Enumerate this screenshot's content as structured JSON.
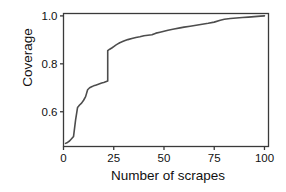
{
  "chart_data": {
    "type": "line",
    "title": "",
    "subtitle": "",
    "xlabel": "Number of scrapes",
    "ylabel": "Coverage",
    "xlim": [
      0,
      102
    ],
    "ylim": [
      0.455,
      1.01
    ],
    "xticks": [
      0,
      25,
      50,
      75,
      100
    ],
    "xtick_labels": [
      "0",
      "25",
      "50",
      "75",
      "100"
    ],
    "yticks": [
      0.6,
      0.8,
      1.0
    ],
    "ytick_labels": [
      "0.6",
      "0.8",
      "1.0"
    ],
    "grid": true,
    "grid_color": "#f0f0f0",
    "legend": null,
    "line_color": "#4d4d4d",
    "line_width": 1.6,
    "background": "#ffffff",
    "panel_border_color": "#3a3a3a",
    "x": [
      1,
      2,
      3,
      4,
      5,
      6,
      7,
      8,
      9,
      10,
      11,
      12,
      13,
      14,
      15,
      16,
      17,
      18,
      19,
      20,
      21,
      22,
      22,
      23,
      24,
      25,
      26,
      27,
      28,
      30,
      32,
      34,
      36,
      38,
      40,
      42,
      44,
      46,
      48,
      50,
      52,
      55,
      58,
      60,
      63,
      66,
      69,
      72,
      75,
      78,
      80,
      83,
      86,
      89,
      92,
      95,
      98,
      100
    ],
    "y": [
      0.468,
      0.472,
      0.478,
      0.487,
      0.497,
      0.565,
      0.618,
      0.628,
      0.636,
      0.648,
      0.663,
      0.692,
      0.7,
      0.704,
      0.708,
      0.711,
      0.714,
      0.717,
      0.72,
      0.722,
      0.725,
      0.728,
      0.855,
      0.861,
      0.866,
      0.872,
      0.878,
      0.883,
      0.888,
      0.895,
      0.901,
      0.906,
      0.91,
      0.913,
      0.917,
      0.919,
      0.921,
      0.928,
      0.932,
      0.936,
      0.94,
      0.945,
      0.95,
      0.953,
      0.957,
      0.961,
      0.965,
      0.969,
      0.974,
      0.982,
      0.986,
      0.989,
      0.991,
      0.993,
      0.995,
      0.997,
      0.999,
      1.0
    ],
    "annotations": []
  }
}
